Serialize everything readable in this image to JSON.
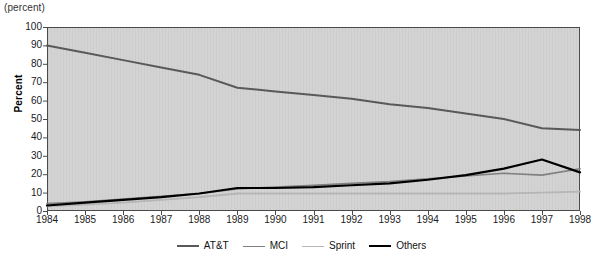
{
  "caption": "(percent)",
  "chart_data": {
    "type": "line",
    "title": "",
    "subtitle": "",
    "unit_caption": "(percent)",
    "xlabel": "",
    "ylabel": "Percent",
    "categories": [
      "1984",
      "1985",
      "1986",
      "1987",
      "1988",
      "1989",
      "1990",
      "1991",
      "1992",
      "1993",
      "1994",
      "1995",
      "1996",
      "1997",
      "1998"
    ],
    "x": [
      1984,
      1985,
      1986,
      1987,
      1988,
      1989,
      1990,
      1991,
      1992,
      1993,
      1994,
      1995,
      1996,
      1997,
      1998
    ],
    "xlim": [
      1984,
      1998
    ],
    "ylim": [
      0,
      100
    ],
    "yticks": [
      0,
      10,
      20,
      30,
      40,
      50,
      60,
      70,
      80,
      90,
      100
    ],
    "grid": false,
    "legend_position": "bottom",
    "series": [
      {
        "name": "AT&T",
        "color": "#595959",
        "width": 2.0,
        "values": [
          90,
          86,
          82,
          78,
          74,
          67,
          65,
          63,
          61,
          58,
          56,
          53,
          50,
          45,
          44
        ]
      },
      {
        "name": "MCI",
        "color": "#808080",
        "width": 1.6,
        "values": [
          4,
          5,
          6.5,
          8,
          9.5,
          12,
          13,
          14,
          15,
          16,
          17.5,
          19,
          20.5,
          19.5,
          23
        ]
      },
      {
        "name": "Sprint",
        "color": "#b5b5b5",
        "width": 1.8,
        "values": [
          2.5,
          3.5,
          4.5,
          6,
          7.5,
          9.5,
          9.5,
          9.5,
          9.5,
          9.5,
          9.5,
          9.5,
          9.5,
          10,
          10.5
        ]
      },
      {
        "name": "Others",
        "color": "#000000",
        "width": 2.2,
        "values": [
          3,
          4.5,
          6,
          7.5,
          9.5,
          12.5,
          12.5,
          13,
          14,
          15,
          17,
          19.5,
          23,
          28,
          21
        ]
      }
    ]
  },
  "axes": {
    "y_tick_labels": [
      "100",
      "90",
      "80",
      "70",
      "60",
      "50",
      "40",
      "30",
      "20",
      "10",
      "0"
    ],
    "y_title": "Percent",
    "x_tick_labels": [
      "1984",
      "1985",
      "1986",
      "1987",
      "1988",
      "1989",
      "1990",
      "1991",
      "1992",
      "1993",
      "1994",
      "1995",
      "1996",
      "1997",
      "1998"
    ]
  },
  "legend": {
    "items": [
      {
        "label": "AT&T",
        "color": "#595959",
        "width": 2.0
      },
      {
        "label": "MCI",
        "color": "#808080",
        "width": 1.6
      },
      {
        "label": "Sprint",
        "color": "#b5b5b5",
        "width": 1.8
      },
      {
        "label": "Others",
        "color": "#000000",
        "width": 2.4
      }
    ]
  },
  "style": {
    "plot_background": "#d4d4d4",
    "plot_border": "#4a4a4a",
    "page_background": "#ffffff"
  }
}
